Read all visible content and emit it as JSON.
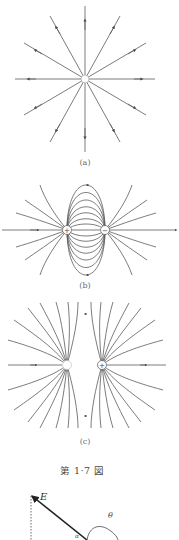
{
  "figures": [
    {
      "id": "a",
      "label": "(a)",
      "description": "Radial field lines of a single point charge",
      "charges": [
        {
          "sign": "+",
          "symbol": ""
        }
      ]
    },
    {
      "id": "b",
      "label": "(b)",
      "description": "Field lines of an electric dipole (positive and negative charge)",
      "charges": [
        {
          "sign": "+",
          "symbol": "+"
        },
        {
          "sign": "-",
          "symbol": "−"
        }
      ]
    },
    {
      "id": "c",
      "label": "(c)",
      "description": "Field lines of two like charges",
      "charges": [
        {
          "sign": "+",
          "symbol": ""
        },
        {
          "sign": "+",
          "symbol": "+"
        }
      ]
    }
  ],
  "caption": "第 1·7 図",
  "vector_diagram": {
    "vector_label": "E",
    "angle_label": "θ",
    "small_label": "α"
  }
}
